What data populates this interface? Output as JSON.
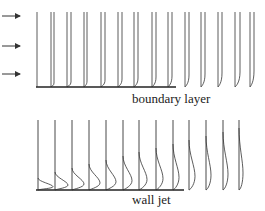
{
  "diagram": {
    "panels": [
      {
        "id": "top",
        "label": "boundary layer",
        "wall": {
          "x1": 36,
          "x2": 176,
          "y": 87
        },
        "profile_top_y": 12,
        "inflow_arrows": [
          {
            "y": 16
          },
          {
            "y": 46
          },
          {
            "y": 74
          }
        ],
        "profiles": [
          {
            "x0": 37,
            "delta": 0,
            "u": 37
          },
          {
            "x0": 51,
            "delta": 4,
            "u": 54
          },
          {
            "x0": 67,
            "delta": 5,
            "u": 71
          },
          {
            "x0": 84,
            "delta": 6,
            "u": 87
          },
          {
            "x0": 101,
            "delta": 7,
            "u": 105
          },
          {
            "x0": 118,
            "delta": 8,
            "u": 122
          },
          {
            "x0": 134,
            "delta": 9,
            "u": 138
          },
          {
            "x0": 152,
            "delta": 10,
            "u": 156
          },
          {
            "x0": 168,
            "delta": 11,
            "u": 172
          },
          {
            "x0": 185,
            "delta": 12,
            "u": 189
          },
          {
            "x0": 201,
            "delta": 13,
            "u": 205
          },
          {
            "x0": 218,
            "delta": 14,
            "u": 222
          },
          {
            "x0": 235,
            "delta": 15,
            "u": 240
          },
          {
            "x0": 250,
            "delta": 16,
            "u": 254
          }
        ]
      },
      {
        "id": "bottom",
        "label": "wall jet",
        "wall": {
          "x1": 36,
          "x2": 184,
          "y": 190
        },
        "profile_top_y": 120,
        "profiles": [
          {
            "x": 38,
            "peak": 15,
            "h": 6
          },
          {
            "x": 55,
            "peak": 13,
            "h": 9
          },
          {
            "x": 72,
            "peak": 12,
            "h": 11
          },
          {
            "x": 89,
            "peak": 11,
            "h": 13
          },
          {
            "x": 106,
            "peak": 10,
            "h": 15
          },
          {
            "x": 123,
            "peak": 9,
            "h": 17
          },
          {
            "x": 139,
            "peak": 8,
            "h": 19
          },
          {
            "x": 156,
            "peak": 7,
            "h": 21
          },
          {
            "x": 173,
            "peak": 6,
            "h": 23
          },
          {
            "x": 189,
            "peak": 6,
            "h": 25
          },
          {
            "x": 206,
            "peak": 5,
            "h": 27
          },
          {
            "x": 223,
            "peak": 5,
            "h": 29
          },
          {
            "x": 239,
            "peak": 4,
            "h": 31
          }
        ]
      }
    ],
    "colors": {
      "line": "#333333",
      "wall": "#222222"
    }
  }
}
